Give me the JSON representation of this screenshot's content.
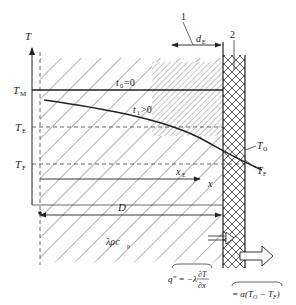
{
  "diagram": {
    "type": "heat-conduction-schematic",
    "axis": {
      "y_label": "T",
      "x_label": "x"
    },
    "temperature_levels": [
      {
        "name": "T_M",
        "main": "T",
        "sub": "M"
      },
      {
        "name": "T_E",
        "main": "T",
        "sub": "E"
      },
      {
        "name": "T_F",
        "main": "T",
        "sub": "F"
      }
    ],
    "curves": {
      "initial": {
        "main": "t",
        "sub": "0",
        "rest": "=0"
      },
      "later": {
        "main": "t",
        "sub": "1",
        "rest": ">0"
      }
    },
    "wall_labels": {
      "outer_temp": {
        "main": "T",
        "sub": "O"
      },
      "fluid_temp": {
        "main": "T",
        "sub": "F"
      }
    },
    "callouts": {
      "one": "1",
      "two": "2"
    },
    "dimensions": {
      "dE": {
        "main": "d",
        "sub": "E"
      },
      "xE": {
        "main": "x",
        "sub": "E"
      },
      "D": "D"
    },
    "material_props": "λρc",
    "material_props_sub": "p",
    "formulas": {
      "conduction": {
        "lhs": "q″ = −λ",
        "num": "∂T",
        "den": "∂x"
      },
      "convection": "= α(T",
      "convection_sub1": "O",
      "convection_mid": " − T",
      "convection_sub2": "F",
      "convection_end": ")"
    },
    "colors": {
      "line": "#222222",
      "hatch": "#555555",
      "background": "#ffffff"
    }
  }
}
